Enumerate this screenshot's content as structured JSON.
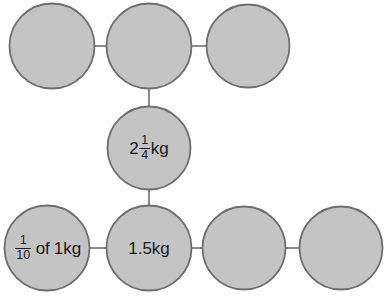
{
  "diagram": {
    "type": "circle-chain-number-bonds",
    "background_color": "#ffffff",
    "node_fill_color": "#c4c4c4",
    "node_stroke_color": "#6e6e6e",
    "connector_color": "#6e6e6e",
    "text_color": "#1a1a1a",
    "nodes": [
      {
        "id": "top-left",
        "label": "",
        "cx": 52,
        "cy": 46,
        "r": 43,
        "filled": true
      },
      {
        "id": "top-middle",
        "label": "",
        "cx": 149,
        "cy": 46,
        "r": 43,
        "filled": true
      },
      {
        "id": "top-right",
        "label": "",
        "cx": 248,
        "cy": 46,
        "r": 42,
        "filled": true
      },
      {
        "id": "middle-center",
        "label": "2 1/4 kg",
        "whole": "2",
        "numerator": "1",
        "denominator": "4",
        "unit": "kg",
        "cx": 149,
        "cy": 148,
        "r": 42,
        "filled": true
      },
      {
        "id": "bottom-left",
        "label": "1/10 of 1kg",
        "numerator": "1",
        "denominator": "10",
        "connector_text": "of",
        "unit": "1kg",
        "cx": 48,
        "cy": 248,
        "r": 43,
        "filled": true
      },
      {
        "id": "bottom-second",
        "label": "1.5kg",
        "cx": 149,
        "cy": 248,
        "r": 43,
        "filled": true
      },
      {
        "id": "bottom-third",
        "label": "",
        "cx": 244,
        "cy": 248,
        "r": 42,
        "filled": true
      },
      {
        "id": "bottom-right",
        "label": "",
        "cx": 341,
        "cy": 248,
        "r": 42,
        "filled": true
      }
    ],
    "connectors": [
      {
        "id": "top-left-to-top-middle",
        "x1": 95,
        "y1": 46,
        "x2": 106,
        "y2": 46
      },
      {
        "id": "top-middle-to-top-right",
        "x1": 192,
        "y1": 46,
        "x2": 206,
        "y2": 46
      },
      {
        "id": "top-middle-to-middle-center",
        "x1": 149,
        "y1": 89,
        "x2": 149,
        "y2": 106
      },
      {
        "id": "middle-center-to-bottom-second",
        "x1": 149,
        "y1": 190,
        "x2": 149,
        "y2": 205
      },
      {
        "id": "bottom-left-to-bottom-second",
        "x1": 91,
        "y1": 248,
        "x2": 106,
        "y2": 248
      },
      {
        "id": "bottom-second-to-bottom-third",
        "x1": 192,
        "y1": 248,
        "x2": 202,
        "y2": 248
      },
      {
        "id": "bottom-third-to-bottom-right",
        "x1": 286,
        "y1": 248,
        "x2": 299,
        "y2": 248
      }
    ]
  },
  "labels": {
    "middle_center": {
      "whole": "2",
      "numerator": "1",
      "denominator": "4",
      "unit": "kg"
    },
    "bottom_left": {
      "numerator": "1",
      "denominator": "10",
      "of": "of",
      "unit": "1kg"
    },
    "bottom_second": {
      "text": "1.5kg"
    }
  }
}
